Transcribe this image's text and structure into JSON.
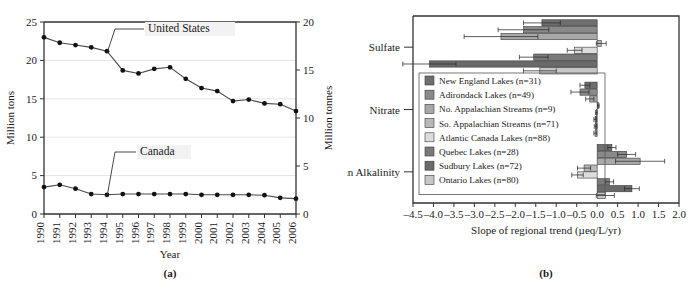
{
  "figure": {
    "panel_a_caption": "(a)",
    "panel_b_caption": "(b)"
  },
  "chart_data": [
    {
      "type": "line",
      "panel": "(a)",
      "title": "",
      "xlabel": "Year",
      "ylabel": "Million tons",
      "ylabel_right": "Million tonnes",
      "grid": true,
      "legend_position": "inline-callout",
      "xlim": [
        1990,
        2006
      ],
      "ylim": [
        0,
        25
      ],
      "yticks": [
        0,
        5,
        10,
        15,
        20,
        25
      ],
      "ylim_right": [
        0,
        20
      ],
      "yticks_right": [
        0,
        5,
        10,
        15,
        20
      ],
      "x": [
        1990,
        1991,
        1992,
        1993,
        1994,
        1995,
        1996,
        1997,
        1998,
        1999,
        2000,
        2001,
        2002,
        2003,
        2004,
        2005,
        2006
      ],
      "xticklabels": [
        "1990",
        "1991",
        "1992",
        "1993",
        "1994",
        "1995",
        "1996",
        "1997",
        "1998",
        "1999",
        "2000",
        "2001",
        "2002",
        "2003",
        "2004",
        "2005",
        "2006"
      ],
      "series": [
        {
          "name": "United States",
          "values": [
            23.0,
            22.3,
            22.0,
            21.7,
            21.2,
            18.7,
            18.3,
            18.9,
            19.1,
            17.6,
            16.4,
            16.0,
            14.7,
            14.9,
            14.4,
            14.3,
            13.4
          ]
        },
        {
          "name": "Canada",
          "values": [
            3.5,
            3.8,
            3.3,
            2.6,
            2.5,
            2.6,
            2.6,
            2.6,
            2.6,
            2.6,
            2.5,
            2.5,
            2.5,
            2.5,
            2.45,
            2.1,
            2.0
          ]
        }
      ],
      "annotations": [
        {
          "text": "United States",
          "target_x": 1994,
          "target_y": 21.2
        },
        {
          "text": "Canada",
          "target_x": 1994,
          "target_y": 2.5
        }
      ]
    },
    {
      "type": "bar",
      "orientation": "horizontal",
      "panel": "(b)",
      "title": "",
      "xlabel": "Slope of regional trend (µeq/L/yr)",
      "ylabel": "",
      "grid": false,
      "legend_position": "inside-left",
      "xlim": [
        -4.5,
        2.0
      ],
      "xticks": [
        -4.5,
        -4.0,
        -3.5,
        -3.0,
        -2.5,
        -2.0,
        -1.5,
        -1.0,
        -0.5,
        0.0,
        0.5,
        1.0,
        1.5,
        2.0
      ],
      "xticklabels": [
        "–4.5",
        "–4.0",
        "–3.5",
        "–3.0",
        "–2.5",
        "–2.0",
        "–1.5",
        "–1.0",
        "–0.5",
        "0.0",
        "0.5",
        "1.0",
        "1.5",
        "2.0"
      ],
      "categories": [
        "Sulfate",
        "Nitrate",
        "Gran Alkalinity"
      ],
      "series": [
        {
          "name": "New England Lakes (n=31)",
          "color": "#6e6e6e",
          "values": [
            -1.35,
            -0.3,
            0.36
          ]
        },
        {
          "name": "Adirondack Lakes (n=49)",
          "color": "#8a8a8a",
          "values": [
            -1.8,
            -0.42,
            0.72
          ]
        },
        {
          "name": "No. Appalachian Streams (n=9)",
          "color": "#a8a8a8",
          "values": [
            -2.35,
            -0.18,
            1.05
          ]
        },
        {
          "name": "So. Appalachian Streams (n=71)",
          "color": "#b8b8b8",
          "values": [
            0.1,
            0.03,
            -0.32
          ]
        },
        {
          "name": "Atlantic Canada Lakes (n=88)",
          "color": "#dcdcdc",
          "values": [
            -0.55,
            -0.02,
            -0.48
          ]
        },
        {
          "name": "Quebec Lakes (n=28)",
          "color": "#7a7a7a",
          "values": [
            -1.55,
            -0.05,
            0.3
          ]
        },
        {
          "name": "Sudbury Lakes (n=72)",
          "color": "#6a6a6a",
          "values": [
            -4.1,
            -0.04,
            0.85
          ]
        },
        {
          "name": "Ontario Lakes (n=80)",
          "color": "#c6c6c6",
          "values": [
            -1.4,
            -0.05,
            0.2
          ]
        }
      ],
      "error_bars": [
        {
          "series": "New England Lakes (n=31)",
          "values": [
            0.45,
            0.12,
            0.1
          ]
        },
        {
          "series": "Adirondack Lakes (n=49)",
          "values": [
            0.62,
            0.22,
            0.22
          ]
        },
        {
          "series": "No. Appalachian Streams (n=9)",
          "values": [
            0.9,
            0.1,
            0.6
          ]
        },
        {
          "series": "So. Appalachian Streams (n=71)",
          "values": [
            0.12,
            0.02,
            0.16
          ]
        },
        {
          "series": "Atlantic Canada Lakes (n=88)",
          "values": [
            0.18,
            0.02,
            0.14
          ]
        },
        {
          "series": "Quebec Lakes (n=28)",
          "values": [
            0.35,
            0.03,
            0.1
          ]
        },
        {
          "series": "Sudbury Lakes (n=72)",
          "values": [
            0.65,
            0.03,
            0.18
          ]
        },
        {
          "series": "Ontario Lakes (n=80)",
          "values": [
            0.4,
            0.03,
            0.22
          ]
        }
      ]
    }
  ]
}
